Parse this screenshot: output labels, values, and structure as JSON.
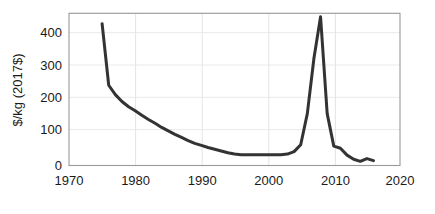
{
  "chart_data": {
    "type": "line",
    "title": "",
    "xlabel": "",
    "ylabel": "$/kg (2017$)",
    "xlim": [
      1970,
      2020
    ],
    "ylim": [
      0,
      440
    ],
    "xticks": [
      1970,
      1980,
      1990,
      2000,
      2010,
      2020
    ],
    "yticks": [
      0,
      100,
      200,
      300,
      400
    ],
    "xtick_labels": [
      "1970",
      "1980",
      "1990",
      "2000",
      "2010",
      "2020"
    ],
    "ytick_labels": [
      "0",
      "100",
      "200",
      "300",
      "400"
    ],
    "grid": "horizontal-and-vertical",
    "legend": "none",
    "line_color": "#333333",
    "line_width": 3,
    "x": [
      1975,
      1976,
      1977,
      1978,
      1979,
      1980,
      1981,
      1982,
      1983,
      1984,
      1985,
      1986,
      1987,
      1988,
      1989,
      1990,
      1991,
      1992,
      1993,
      1994,
      1995,
      1996,
      1997,
      1998,
      1999,
      2000,
      2001,
      2002,
      2003,
      2004,
      2005,
      2006,
      2007,
      2008,
      2009,
      2010,
      2011,
      2012,
      2013,
      2014,
      2015,
      2016
    ],
    "values": [
      410,
      232,
      205,
      185,
      170,
      158,
      145,
      133,
      122,
      110,
      100,
      90,
      81,
      72,
      64,
      58,
      52,
      47,
      42,
      37,
      33,
      31,
      31,
      31,
      31,
      31,
      31,
      31,
      33,
      40,
      60,
      150,
      310,
      430,
      150,
      56,
      50,
      30,
      18,
      12,
      20,
      14
    ]
  },
  "axes": {
    "y_axis_label": "$/kg (2017$)"
  }
}
